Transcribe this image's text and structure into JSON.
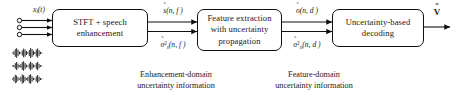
{
  "diagram": {
    "title_visible": false,
    "input_label": "x_i(t)",
    "input_label_parts": {
      "base": "x",
      "sub": "i",
      "tail": "(t)"
    },
    "output_label": "v̂",
    "blocks": [
      {
        "id": "stft",
        "lines": [
          "STFT + speech",
          "enhancement"
        ]
      },
      {
        "id": "feature",
        "lines": [
          "Feature extraction",
          "with uncertainty",
          "propagation"
        ]
      },
      {
        "id": "decoding",
        "lines": [
          "Uncertainty-based",
          "decoding"
        ]
      }
    ],
    "signal_labels": [
      {
        "id": "s-tilde",
        "base": "s",
        "accent": "˜",
        "tail": "(n, f )"
      },
      {
        "id": "sigma-s",
        "base": "σ",
        "accent": "˜",
        "sup": "2",
        "sub": "s",
        "tail": "(n, f )"
      },
      {
        "id": "o-tilde",
        "base": "o",
        "accent": "˜",
        "tail": "(n, d )"
      },
      {
        "id": "sigma-o",
        "base": "σ",
        "accent": "˜",
        "sup": "2",
        "sub": "o",
        "tail": "(n, d )"
      }
    ],
    "captions": [
      {
        "id": "enhancement-domain",
        "lines": [
          "Enhancement-domain",
          "uncertainty information"
        ]
      },
      {
        "id": "feature-domain",
        "lines": [
          "Feature-domain",
          "uncertainty information"
        ]
      }
    ],
    "microphone_count": 3,
    "waveform_count": 3,
    "colors": {
      "line": "#111111",
      "text": "#1a1a1a",
      "background": "#ffffff"
    }
  }
}
